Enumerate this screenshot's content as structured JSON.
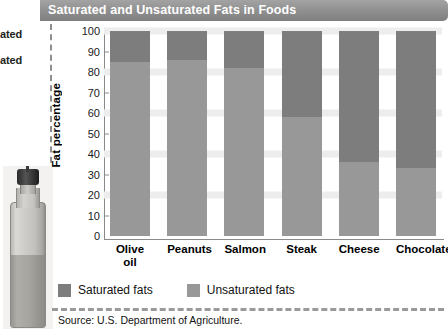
{
  "figure": {
    "title": "Saturated and Unsaturated Fats in Foods",
    "source": "Source: U.S. Department of Agriculture."
  },
  "left_margin": {
    "clipped_line_1": "ated",
    "clipped_line_2": "ated",
    "photo_alt": "olive-oil-bottle"
  },
  "legend": {
    "items": [
      {
        "label": "Saturated fats",
        "color": "#7d7d7d"
      },
      {
        "label": "Unsaturated fats",
        "color": "#989898"
      }
    ]
  },
  "chart_data": {
    "type": "bar",
    "stacked": true,
    "title": "Saturated and Unsaturated Fats in Foods",
    "xlabel": "",
    "ylabel": "Fat percentage",
    "ylim": [
      0,
      100
    ],
    "yticks": [
      100,
      90,
      80,
      70,
      60,
      50,
      40,
      30,
      20,
      10,
      0
    ],
    "grid": "horizontal bands every 20 units",
    "legend_position": "bottom-left",
    "categories": [
      "Olive oil",
      "Peanuts",
      "Salmon",
      "Steak",
      "Cheese",
      "Chocolate"
    ],
    "series": [
      {
        "name": "Saturated fats",
        "color": "#7d7d7d",
        "values": [
          15,
          14,
          18,
          42,
          64,
          67
        ]
      },
      {
        "name": "Unsaturated fats",
        "color": "#989898",
        "values": [
          85,
          86,
          82,
          58,
          36,
          33
        ]
      }
    ]
  }
}
